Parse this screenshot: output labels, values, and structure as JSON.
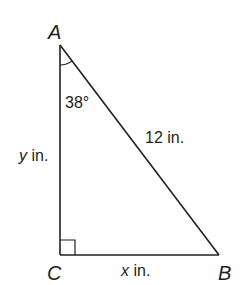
{
  "diagram": {
    "type": "right-triangle",
    "stroke_color": "#231f20",
    "vertices": {
      "A": {
        "label": "A",
        "x": 60,
        "y": 45
      },
      "B": {
        "label": "B",
        "x": 219,
        "y": 255
      },
      "C": {
        "label": "C",
        "x": 60,
        "y": 255
      }
    },
    "right_angle_at": "C",
    "angle_A": {
      "label": "38°",
      "value_deg": 38
    },
    "sides": {
      "AB": {
        "label": "12 in.",
        "role": "hypotenuse"
      },
      "AC": {
        "var": "y",
        "unit": " in.",
        "label": "y in."
      },
      "CB": {
        "var": "x",
        "unit": " in.",
        "label": "x in."
      }
    }
  }
}
